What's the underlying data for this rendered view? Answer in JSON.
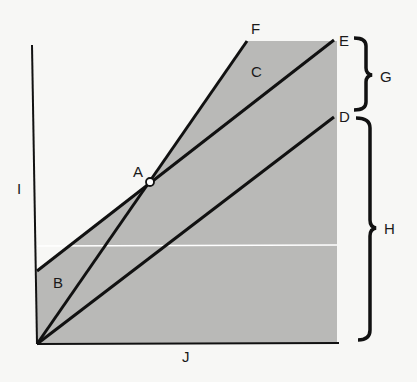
{
  "colors": {
    "background": "#f7f7f5",
    "shade": "#b9b9b7",
    "line": "#111111",
    "highlight_line": "#ffffff"
  },
  "labels": {
    "A": "A",
    "B": "B",
    "C": "C",
    "D": "D",
    "E": "E",
    "F": "F",
    "G": "G",
    "H": "H",
    "I": "I",
    "J": "J"
  },
  "geometry": {
    "origin": [
      37,
      344
    ],
    "y_axis_top": [
      33,
      45
    ],
    "x_axis_end": [
      337,
      344
    ],
    "shaded_polygon": [
      [
        37,
        271
      ],
      [
        150,
        182
      ],
      [
        247,
        41
      ],
      [
        337,
        41
      ],
      [
        337,
        344
      ],
      [
        37,
        344
      ]
    ],
    "lines": {
      "origin_to_F": [
        [
          37,
          344
        ],
        [
          247,
          41
        ]
      ],
      "B_to_E": [
        [
          37,
          271
        ],
        [
          333,
          41
        ]
      ],
      "origin_to_D": [
        [
          37,
          344
        ],
        [
          333,
          118
        ]
      ]
    },
    "point_A": [
      150,
      182
    ],
    "white_rule_y": 246
  }
}
